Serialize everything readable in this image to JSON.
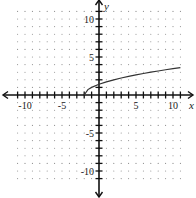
{
  "chart_data": {
    "type": "line",
    "title": "",
    "xlabel": "x",
    "ylabel": "y",
    "xlim": [
      -11,
      11
    ],
    "ylim": [
      -11,
      11
    ],
    "grid": "dotted",
    "x_tick_labels": [
      {
        "value": -10,
        "label": "-10"
      },
      {
        "value": -5,
        "label": "-5"
      },
      {
        "value": 5,
        "label": "5"
      },
      {
        "value": 10,
        "label": "10"
      }
    ],
    "y_tick_labels": [
      {
        "value": 10,
        "label": "10"
      },
      {
        "value": 5,
        "label": "5"
      },
      {
        "value": -5,
        "label": "-5"
      },
      {
        "value": -10,
        "label": "-10"
      }
    ],
    "series": [
      {
        "name": "y = sqrt(x + 2)",
        "x": [
          -2,
          -1.5,
          -1,
          0,
          1,
          2,
          3,
          4,
          5,
          6,
          7,
          8,
          9,
          10,
          11
        ],
        "values": [
          0,
          0.71,
          1,
          1.41,
          1.73,
          2,
          2.24,
          2.45,
          2.65,
          2.83,
          3,
          3.16,
          3.32,
          3.46,
          3.61
        ]
      }
    ]
  },
  "colors": {
    "axis": "#111111",
    "grid_dot": "#8a8a8a",
    "curve": "#333333"
  }
}
